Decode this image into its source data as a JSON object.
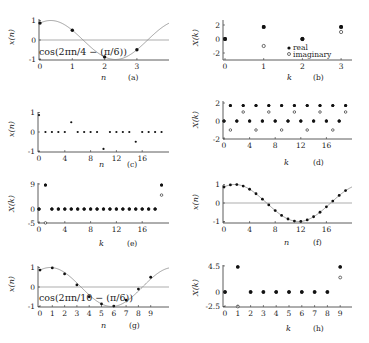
{
  "figure": {
    "panels": [
      {
        "id": "a",
        "caption": "(a)",
        "xlabel": "n",
        "ylabel": "x(n)",
        "annotation": "cos(2πn/4 − (π/6))"
      },
      {
        "id": "b",
        "caption": "(b)",
        "xlabel": "k",
        "ylabel": "X(k)",
        "legend": [
          "real",
          "imaginary"
        ]
      },
      {
        "id": "c",
        "caption": "(c)",
        "xlabel": "n",
        "ylabel": "x(n)"
      },
      {
        "id": "d",
        "caption": "(d)",
        "xlabel": "k",
        "ylabel": "X(k)"
      },
      {
        "id": "e",
        "caption": "(e)",
        "xlabel": "k",
        "ylabel": "X(k)"
      },
      {
        "id": "f",
        "caption": "(f)",
        "xlabel": "n",
        "ylabel": "x(n)"
      },
      {
        "id": "g",
        "caption": "(g)",
        "xlabel": "n",
        "ylabel": "x(n)",
        "annotation": "cos(2πn/10 − (π/6))"
      },
      {
        "id": "h",
        "caption": "(h)",
        "xlabel": "k",
        "ylabel": "X(k)"
      }
    ]
  },
  "chart_data": [
    {
      "id": "a",
      "type": "scatter",
      "title": "",
      "caption": "(a)",
      "xlabel": "n",
      "ylabel": "x(n)",
      "x_ticks": [
        0,
        1,
        2,
        3
      ],
      "y_ticks": [
        -1,
        0,
        1
      ],
      "ylim": [
        -1,
        1
      ],
      "xlim": [
        0,
        3.9
      ],
      "annotation": "cos(2πn/4 − (π/6))",
      "continuous_curve": "cos(2πt/4 − π/6)",
      "series": [
        {
          "name": "x(n)",
          "x": [
            0,
            1,
            2,
            3
          ],
          "values": [
            0.866,
            0.5,
            -0.866,
            -0.5
          ]
        }
      ],
      "grid": false
    },
    {
      "id": "b",
      "type": "scatter",
      "title": "",
      "caption": "(b)",
      "xlabel": "k",
      "ylabel": "X(k)",
      "x_ticks": [
        0,
        1,
        2,
        3
      ],
      "y_ticks": [
        -2,
        0,
        2
      ],
      "ylim": [
        -3,
        2.8
      ],
      "xlim": [
        0,
        3.3
      ],
      "legend": {
        "entries": [
          "real",
          "imaginary"
        ],
        "position": "center-right"
      },
      "series": [
        {
          "name": "real",
          "marker": "filled",
          "x": [
            0,
            1,
            2,
            3
          ],
          "values": [
            0,
            1.732,
            0,
            1.732
          ]
        },
        {
          "name": "imaginary",
          "marker": "hollow",
          "x": [
            0,
            1,
            2,
            3
          ],
          "values": [
            0,
            -1,
            0,
            1
          ]
        }
      ],
      "grid": false
    },
    {
      "id": "c",
      "type": "scatter",
      "title": "",
      "caption": "(c)",
      "xlabel": "n",
      "ylabel": "x(n)",
      "x_ticks": [
        0,
        4,
        8,
        12,
        16
      ],
      "y_ticks": [
        -1,
        0,
        1
      ],
      "ylim": [
        -1,
        1
      ],
      "xlim": [
        0,
        19.5
      ],
      "series": [
        {
          "name": "x(n)",
          "x": [
            0,
            1,
            2,
            3,
            4,
            5,
            6,
            7,
            8,
            9,
            10,
            11,
            12,
            13,
            14,
            15,
            16,
            17,
            18,
            19
          ],
          "values": [
            0.866,
            0,
            0,
            0,
            0,
            0.5,
            0,
            0,
            0,
            0,
            -0.866,
            0,
            0,
            0,
            0,
            -0.5,
            0,
            0,
            0,
            0
          ]
        }
      ],
      "grid": false
    },
    {
      "id": "d",
      "type": "scatter",
      "title": "",
      "caption": "(d)",
      "xlabel": "k",
      "ylabel": "X(k)",
      "x_ticks": [
        0,
        4,
        8,
        12,
        16
      ],
      "y_ticks": [
        -2,
        0,
        2
      ],
      "ylim": [
        -2,
        2
      ],
      "xlim": [
        0,
        19.5
      ],
      "series": [
        {
          "name": "real",
          "marker": "filled",
          "x": [
            0,
            1,
            2,
            3,
            4,
            5,
            6,
            7,
            8,
            9,
            10,
            11,
            12,
            13,
            14,
            15,
            16,
            17,
            18,
            19
          ],
          "values": [
            0,
            1.732,
            0,
            1.732,
            0,
            1.732,
            0,
            1.732,
            0,
            1.732,
            0,
            1.732,
            0,
            1.732,
            0,
            1.732,
            0,
            1.732,
            0,
            1.732
          ]
        },
        {
          "name": "imaginary",
          "marker": "hollow",
          "x": [
            0,
            1,
            2,
            3,
            4,
            5,
            6,
            7,
            8,
            9,
            10,
            11,
            12,
            13,
            14,
            15,
            16,
            17,
            18,
            19
          ],
          "values": [
            0,
            -1,
            0,
            1,
            0,
            -1,
            0,
            1,
            0,
            -1,
            0,
            1,
            0,
            -1,
            0,
            1,
            0,
            -1,
            0,
            1
          ]
        }
      ],
      "grid": false
    },
    {
      "id": "e",
      "type": "scatter",
      "title": "",
      "caption": "(e)",
      "xlabel": "k",
      "ylabel": "X(k)",
      "x_ticks": [
        0,
        4,
        8,
        12,
        16
      ],
      "y_ticks": [
        -5,
        0,
        9
      ],
      "ylim": [
        -5,
        9
      ],
      "xlim": [
        0,
        19.5
      ],
      "series": [
        {
          "name": "real",
          "marker": "filled",
          "x": [
            0,
            1,
            2,
            3,
            4,
            5,
            6,
            7,
            8,
            9,
            10,
            11,
            12,
            13,
            14,
            15,
            16,
            17,
            18,
            19
          ],
          "values": [
            0,
            8.66,
            0,
            0,
            0,
            0,
            0,
            0,
            0,
            0,
            0,
            0,
            0,
            0,
            0,
            0,
            0,
            0,
            0,
            8.66
          ]
        },
        {
          "name": "imaginary",
          "marker": "hollow",
          "x": [
            0,
            1,
            2,
            3,
            4,
            5,
            6,
            7,
            8,
            9,
            10,
            11,
            12,
            13,
            14,
            15,
            16,
            17,
            18,
            19
          ],
          "values": [
            0,
            -5,
            0,
            0,
            0,
            0,
            0,
            0,
            0,
            0,
            0,
            0,
            0,
            0,
            0,
            0,
            0,
            0,
            0,
            5
          ]
        }
      ],
      "grid": false
    },
    {
      "id": "f",
      "type": "scatter",
      "title": "",
      "caption": "(f)",
      "xlabel": "n",
      "ylabel": "x(n)",
      "x_ticks": [
        0,
        4,
        8,
        12,
        16
      ],
      "y_ticks": [
        -1,
        0,
        1
      ],
      "ylim": [
        -1,
        1
      ],
      "xlim": [
        0,
        19.5
      ],
      "continuous_curve": "cos(2πt/20 − π/6)",
      "series": [
        {
          "name": "x(n)",
          "x": [
            0,
            1,
            2,
            3,
            4,
            5,
            6,
            7,
            8,
            9,
            10,
            11,
            12,
            13,
            14,
            15,
            16,
            17,
            18,
            19
          ],
          "values": [
            0.866,
            0.978,
            0.995,
            0.914,
            0.743,
            0.5,
            0.208,
            -0.105,
            -0.407,
            -0.669,
            -0.866,
            -0.978,
            -0.995,
            -0.914,
            -0.743,
            -0.5,
            -0.208,
            0.105,
            0.407,
            0.669
          ]
        }
      ],
      "grid": false
    },
    {
      "id": "g",
      "type": "scatter",
      "title": "",
      "caption": "(g)",
      "xlabel": "n",
      "ylabel": "x(n)",
      "x_ticks": [
        0,
        1,
        2,
        3,
        4,
        5,
        6,
        7,
        8,
        9
      ],
      "y_ticks": [
        -1,
        0,
        1
      ],
      "ylim": [
        -1,
        1
      ],
      "xlim": [
        0,
        9.8
      ],
      "annotation": "cos(2πn/10 − (π/6))",
      "continuous_curve": "cos(2πt/10 − π/6)",
      "series": [
        {
          "name": "x(n)",
          "x": [
            0,
            1,
            2,
            3,
            4,
            5,
            6,
            7,
            8,
            9
          ],
          "values": [
            0.866,
            0.978,
            0.669,
            0.105,
            -0.5,
            -0.866,
            -0.978,
            -0.669,
            -0.105,
            0.5
          ]
        }
      ],
      "grid": false
    },
    {
      "id": "h",
      "type": "scatter",
      "title": "",
      "caption": "(h)",
      "xlabel": "k",
      "ylabel": "X(k)",
      "x_ticks": [
        0,
        1,
        2,
        3,
        4,
        5,
        6,
        7,
        8,
        9
      ],
      "y_ticks": [
        -2.5,
        0,
        4.5
      ],
      "ylim": [
        -2.5,
        4.5
      ],
      "xlim": [
        0,
        9.8
      ],
      "series": [
        {
          "name": "real",
          "marker": "filled",
          "x": [
            0,
            1,
            2,
            3,
            4,
            5,
            6,
            7,
            8,
            9
          ],
          "values": [
            0,
            4.33,
            0,
            0,
            0,
            0,
            0,
            0,
            0,
            4.33
          ]
        },
        {
          "name": "imaginary",
          "marker": "hollow",
          "x": [
            0,
            1,
            2,
            3,
            4,
            5,
            6,
            7,
            8,
            9
          ],
          "values": [
            0,
            -2.5,
            0,
            0,
            0,
            0,
            0,
            0,
            0,
            2.5
          ]
        }
      ],
      "grid": false
    }
  ]
}
